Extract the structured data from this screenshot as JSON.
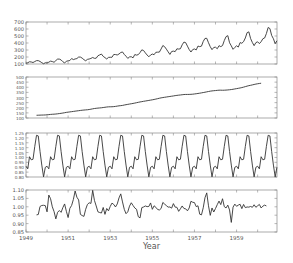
{
  "chart_data": {
    "type": "line",
    "title": "",
    "xlabel": "Year",
    "x_ticks": [
      "1949",
      "1951",
      "1953",
      "1955",
      "1957",
      "1959"
    ],
    "x_range": [
      1949,
      1960.92
    ],
    "line_color": "#333333",
    "axis_color": "#888888",
    "text_color": "#555555",
    "panels": [
      {
        "name": "observed",
        "ylim": [
          100,
          700
        ],
        "yticks": [
          "100",
          "200",
          "300",
          "400",
          "500",
          "600",
          "700"
        ],
        "start_index": 0,
        "values": [
          112,
          118,
          132,
          129,
          121,
          135,
          148,
          148,
          136,
          119,
          104,
          118,
          115,
          126,
          141,
          135,
          125,
          149,
          170,
          170,
          158,
          133,
          114,
          140,
          145,
          150,
          178,
          163,
          172,
          178,
          199,
          199,
          184,
          162,
          146,
          166,
          171,
          180,
          193,
          181,
          183,
          218,
          230,
          242,
          209,
          191,
          172,
          194,
          196,
          196,
          236,
          235,
          229,
          243,
          264,
          272,
          237,
          211,
          180,
          201,
          204,
          188,
          235,
          227,
          234,
          264,
          302,
          293,
          259,
          229,
          203,
          229,
          242,
          233,
          267,
          269,
          270,
          315,
          364,
          347,
          312,
          274,
          237,
          278,
          284,
          277,
          317,
          313,
          318,
          374,
          413,
          405,
          355,
          306,
          271,
          306,
          315,
          301,
          356,
          348,
          355,
          422,
          465,
          467,
          404,
          347,
          305,
          336,
          340,
          318,
          362,
          348,
          363,
          435,
          491,
          505,
          404,
          359,
          310,
          337,
          360,
          342,
          406,
          396,
          420,
          472,
          548,
          559,
          463,
          407,
          362,
          405,
          417,
          391,
          419,
          461,
          472,
          535,
          622,
          606,
          508,
          461,
          390,
          432
        ]
      },
      {
        "name": "trend",
        "ylim": [
          100,
          500
        ],
        "yticks": [
          "100",
          "150",
          "200",
          "250",
          "300",
          "350",
          "400",
          "450",
          "500"
        ],
        "start_index": 6,
        "values": [
          126.8,
          127.2,
          127.9,
          128.6,
          129.0,
          129.8,
          131.3,
          133.1,
          134.9,
          136.4,
          137.4,
          138.8,
          140.9,
          143.2,
          145.7,
          148.4,
          151.5,
          154.7,
          157.1,
          159.5,
          161.8,
          164.3,
          166.7,
          169.0,
          171.3,
          173.7,
          175.8,
          177.5,
          179.0,
          180.5,
          182.8,
          186.0,
          189.5,
          192.4,
          194.7,
          196.6,
          198.0,
          199.8,
          202.2,
          204.6,
          207.1,
          208.9,
          209.4,
          209.8,
          211.0,
          213.2,
          215.9,
          218.6,
          220.5,
          222.8,
          226.5,
          229.9,
          233.0,
          236.0,
          239.1,
          242.1,
          245.5,
          249.3,
          253.0,
          256.6,
          259.5,
          262.8,
          265.7,
          268.6,
          271.5,
          274.4,
          277.5,
          280.9,
          284.5,
          288.6,
          292.8,
          296.6,
          299.5,
          302.1,
          304.9,
          307.6,
          310.0,
          312.6,
          315.2,
          318.2,
          320.6,
          322.8,
          324.7,
          326.9,
          329.0,
          329.9,
          329.8,
          330.1,
          331.0,
          332.3,
          334.5,
          336.9,
          339.4,
          342.0,
          345.2,
          348.2,
          351.4,
          355.0,
          358.4,
          361.8,
          364.2,
          366.2,
          367.8,
          369.7,
          371.3,
          371.4,
          370.7,
          371.2,
          372.4,
          373.8,
          375.6,
          377.5,
          380.2,
          383.4,
          386.4,
          389.8,
          393.0,
          396.7,
          401.2,
          406.1,
          411.0,
          415.6,
          419.0,
          423.0,
          427.0,
          430.8,
          434.1,
          436.8,
          439.3
        ]
      },
      {
        "name": "seasonal",
        "ylim": [
          0.8,
          1.25
        ],
        "yticks": [
          "0.80",
          "0.85",
          "0.90",
          "0.95",
          "1.00",
          "1.05",
          "1.10",
          "1.15",
          "1.20",
          "1.25"
        ],
        "start_index": 0,
        "pattern": [
          0.9102,
          0.8836,
          1.0073,
          0.9759,
          0.9814,
          1.1127,
          1.2266,
          1.2199,
          1.0605,
          0.9218,
          0.8013,
          0.8988
        ],
        "repeat_years": 12
      },
      {
        "name": "residual",
        "ylim": [
          0.85,
          1.1
        ],
        "yticks": [
          "0.85",
          "0.90",
          "0.95",
          "1.00",
          "1.05",
          "1.10"
        ],
        "start_index": 6,
        "values": [
          0.952,
          0.954,
          1.002,
          1.008,
          1.009,
          1.007,
          0.97,
          1.07,
          1.048,
          1.0,
          0.971,
          0.928,
          0.967,
          0.978,
          0.967,
          0.995,
          1.017,
          0.973,
          0.936,
          0.991,
          1.008,
          1.044,
          1.094,
          1.057,
          1.041,
          0.955,
          0.948,
          0.943,
          0.985,
          1.014,
          1.024,
          1.02,
          1.098,
          1.038,
          1.005,
          0.97,
          0.966,
          0.963,
          0.996,
          0.955,
          0.99,
          0.976,
          1.002,
          1.022,
          1.014,
          0.999,
          1.017,
          1.053,
          1.077,
          1.029,
          0.985,
          0.959,
          0.97,
          1.004,
          1.024,
          1.008,
          0.993,
          0.985,
          0.941,
          0.934,
          0.995,
          0.999,
          1.005,
          1.001,
          1.002,
          1.023,
          0.985,
          1.006,
          0.997,
          0.984,
          0.981,
          0.99,
          1.026,
          1.016,
          1.007,
          0.998,
          0.999,
          0.992,
          1.019,
          0.998,
          0.997,
          0.973,
          0.988,
          1.005,
          0.99,
          0.988,
          0.976,
          0.993,
          1.033,
          1.027,
          1.025,
          1.001,
          1.006,
          0.956,
          0.952,
          0.994,
          1.054,
          1.083,
          1.006,
          0.949,
          0.993,
          0.969,
          0.99,
          1.013,
          1.034,
          1.013,
          1.048,
          1.001,
          0.993,
          1.01,
          0.981,
          0.907,
          0.998,
          1.016,
          1.003,
          1.01,
          1.015,
          0.989,
          1.014,
          0.995,
          0.999,
          0.998,
          1.002,
          0.997,
          1.012,
          0.997,
          1.006,
          1.014,
          0.993,
          1.004,
          1.01,
          1.005
        ]
      }
    ]
  },
  "layout": {
    "plot_left": 26,
    "plot_right": 277,
    "panels_y": [
      [
        22,
        64
      ],
      [
        77,
        118
      ],
      [
        133,
        177
      ],
      [
        190,
        232
      ]
    ],
    "xlabel_y": 249
  }
}
